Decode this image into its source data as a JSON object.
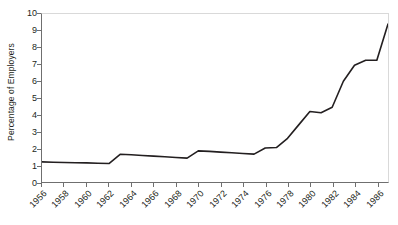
{
  "chart_data": {
    "type": "line",
    "title": "",
    "xlabel": "",
    "ylabel": "Percentage of Employers",
    "xlim": [
      1956,
      1987
    ],
    "ylim": [
      0,
      10
    ],
    "grid": false,
    "legend": null,
    "y_ticks": [
      0,
      1,
      2,
      3,
      4,
      5,
      6,
      7,
      8,
      9,
      10
    ],
    "y_tick_labels": [
      "0",
      "1",
      "2",
      "3",
      "4",
      "5",
      "6",
      "7",
      "8",
      "9",
      "10"
    ],
    "x_ticks": [
      1956,
      1958,
      1960,
      1962,
      1964,
      1966,
      1968,
      1970,
      1972,
      1974,
      1976,
      1978,
      1980,
      1982,
      1984,
      1986
    ],
    "x_tick_labels": [
      "1956",
      "1958",
      "1960",
      "1962",
      "1964",
      "1966",
      "1968",
      "1970",
      "1972",
      "1974",
      "1976",
      "1978",
      "1980",
      "1982",
      "1984",
      "1986"
    ],
    "line_color": "#231f20",
    "line_width": 1.6,
    "series": [
      {
        "name": "Percentage of Employers",
        "x": [
          1956,
          1957,
          1958,
          1959,
          1960,
          1961,
          1962,
          1963,
          1964,
          1965,
          1966,
          1967,
          1968,
          1969,
          1970,
          1971,
          1972,
          1973,
          1974,
          1975,
          1976,
          1977,
          1978,
          1979,
          1980,
          1981,
          1982,
          1983,
          1984,
          1985,
          1986,
          1987
        ],
        "values": [
          1.2,
          1.18,
          1.16,
          1.15,
          1.14,
          1.12,
          1.1,
          1.65,
          1.62,
          1.58,
          1.54,
          1.5,
          1.46,
          1.42,
          1.85,
          1.82,
          1.78,
          1.74,
          1.7,
          1.66,
          2.02,
          2.05,
          2.6,
          3.4,
          4.2,
          4.12,
          4.45,
          6.0,
          6.95,
          7.25,
          7.25,
          9.4
        ]
      }
    ]
  },
  "axes": {
    "y_title": "Percentage of Employers"
  }
}
